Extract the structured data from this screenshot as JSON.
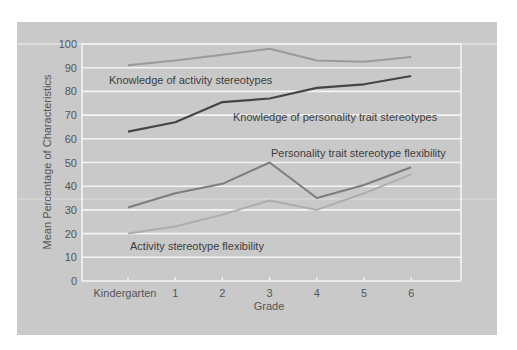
{
  "chart_data": {
    "type": "line",
    "title": "",
    "xlabel": "Grade",
    "ylabel": "Mean Percentage of Characteristics",
    "categories": [
      "Kindergarten",
      "1",
      "2",
      "3",
      "4",
      "5",
      "6"
    ],
    "ylim": [
      0,
      100
    ],
    "yticks": [
      0,
      10,
      20,
      30,
      40,
      50,
      60,
      70,
      80,
      90,
      100
    ],
    "grid": true,
    "legend": "inline-labels",
    "series": [
      {
        "name": "Knowledge of activity stereotypes",
        "color": "#9a9a9a",
        "values": [
          91,
          93,
          95.5,
          98,
          93,
          92.5,
          94.5
        ]
      },
      {
        "name": "Knowledge of personality trait stereotypes",
        "color": "#454545",
        "values": [
          63,
          67,
          75.5,
          77,
          81.5,
          83,
          86.5
        ]
      },
      {
        "name": "Personality trait stereotype flexibility",
        "color": "#7d7d7d",
        "values": [
          31,
          37,
          41,
          50,
          35,
          40.5,
          48
        ]
      },
      {
        "name": "Activity stereotype flexibility",
        "color": "#adadad",
        "values": [
          20,
          23,
          28,
          34,
          30,
          37,
          45
        ]
      }
    ]
  },
  "colors": {
    "panel_background": "#c9c9c9",
    "gridline": "#f4f4f4"
  }
}
